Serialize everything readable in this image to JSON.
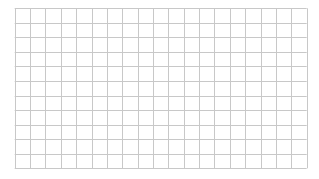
{
  "canvas": {
    "width": 319,
    "height": 179,
    "background": "#ffffff"
  },
  "grid": {
    "left": 14.7,
    "top": 8.3,
    "right": 306.7,
    "bottom": 168.3,
    "columns": 19,
    "rows": 11,
    "line_color": "#c8c8c8",
    "line_width": 1
  }
}
